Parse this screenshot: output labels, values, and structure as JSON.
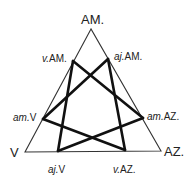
{
  "diagram": {
    "type": "triangle-hexagram",
    "colors": {
      "background": "#ffffff",
      "stroke": "#111111",
      "text": "#222222"
    },
    "vertices": {
      "top": {
        "label": "AM.",
        "x": 91,
        "y": 29
      },
      "left": {
        "label": "V",
        "x": 25,
        "y": 152
      },
      "right": {
        "label": "AZ.",
        "x": 161,
        "y": 151
      }
    },
    "points": [
      {
        "id": "vAM",
        "label": "v.AM.",
        "x": 73,
        "y": 61
      },
      {
        "id": "ajAM",
        "label": "aj.AM.",
        "x": 108,
        "y": 59
      },
      {
        "id": "amV",
        "label": "am.V",
        "x": 43,
        "y": 119
      },
      {
        "id": "amAZ",
        "label": "am.AZ.",
        "x": 143,
        "y": 118
      },
      {
        "id": "ajV",
        "label": "aj.V",
        "x": 58,
        "y": 151
      },
      {
        "id": "vAZ",
        "label": "v.AZ.",
        "x": 125,
        "y": 150
      }
    ],
    "edges": [
      [
        "vAM",
        "ajV"
      ],
      [
        "vAM",
        "amAZ"
      ],
      [
        "ajAM",
        "vAZ"
      ],
      [
        "ajAM",
        "amV"
      ],
      [
        "amV",
        "vAZ"
      ],
      [
        "amAZ",
        "ajV"
      ]
    ]
  },
  "labels": {
    "top": "AM.",
    "left": "V",
    "right": "AZ.",
    "v_am": "v.AM.",
    "aj_am": "aj.AM.",
    "am_v": "am.V",
    "am_az": "am.AZ.",
    "aj_v": "aj.V",
    "v_az": "v.AZ."
  }
}
